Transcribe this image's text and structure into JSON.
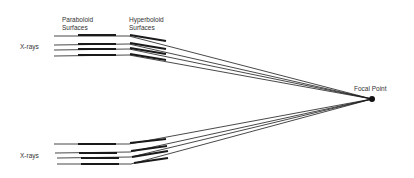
{
  "labels": {
    "paraboloid": [
      "Paraboloid",
      "Surfaces"
    ],
    "hyperboloid": [
      "Hyperboloid",
      "Surfaces"
    ],
    "xrays_top": "X-rays",
    "xrays_bottom": "X-rays",
    "focal_point": "Focal Point"
  },
  "colors": {
    "line": "#1a1a1a",
    "text": "#333333"
  },
  "focal_point": {
    "x": 372,
    "y": 99
  }
}
